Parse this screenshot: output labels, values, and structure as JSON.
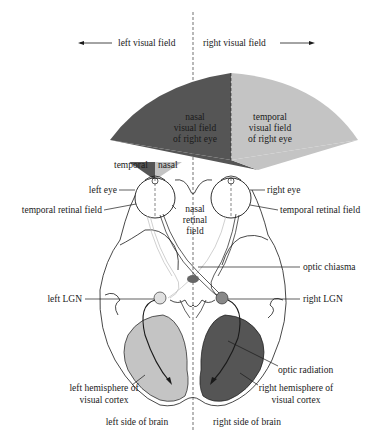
{
  "colors": {
    "dark": "#555555",
    "light": "#c4c4c4",
    "mid": "#9a9a9a",
    "outline": "#1a1a1a",
    "background": "#ffffff"
  },
  "top": {
    "left_visual_field": "left visual field",
    "right_visual_field": "right visual field"
  },
  "fields": {
    "nasal_right": [
      "nasal",
      "visual field",
      "of right eye"
    ],
    "temporal_right": [
      "temporal",
      "visual field",
      "of right eye"
    ],
    "small_temporal": "temporal",
    "small_nasal": "nasal"
  },
  "labels": {
    "left_eye": "left eye",
    "right_eye": "right eye",
    "temporal_retinal_field_left": "temporal retinal field",
    "temporal_retinal_field_right": "temporal retinal field",
    "nasal_retinal_field": [
      "nasal",
      "retinal",
      "field"
    ],
    "optic_chiasma": "optic chiasma",
    "left_lgn": "left LGN",
    "right_lgn": "right LGN",
    "optic_radiation": "optic radiation",
    "left_hemisphere": [
      "left hemisphere of",
      "visual cortex"
    ],
    "right_hemisphere": [
      "right hemisphere of",
      "visual cortex"
    ]
  },
  "bottom": {
    "left_side": "left side of brain",
    "right_side": "right side of brain"
  }
}
